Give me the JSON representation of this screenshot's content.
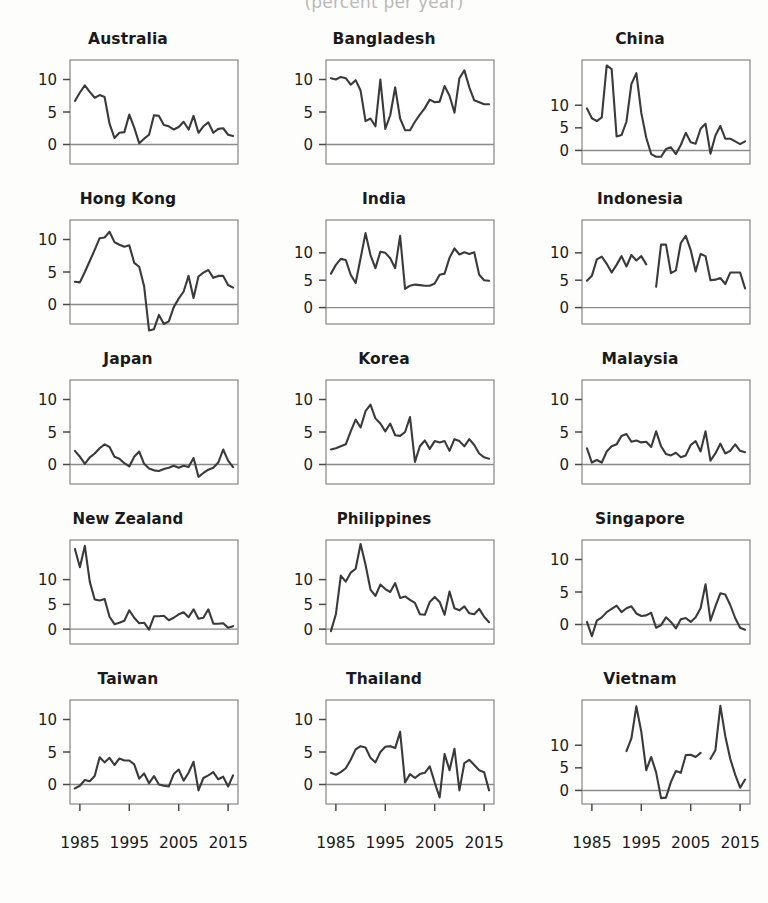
{
  "figure": {
    "title": "(percent per year)",
    "panel_cols": 3,
    "panel_rows": 5
  },
  "axes": {
    "x_ticks": [
      1985,
      1995,
      2005,
      2015
    ],
    "x_tick_labels": [
      "1985",
      "1995",
      "2005",
      "2015"
    ],
    "x_range": [
      1983,
      2017
    ],
    "default_y_ticks": [
      0,
      5,
      10
    ],
    "default_y_tick_labels": [
      "0",
      "5",
      "10"
    ],
    "default_y_range": [
      -3,
      13
    ],
    "wide_y_range": [
      -3,
      20
    ],
    "zero_line": true
  },
  "chart_data": {
    "type": "line",
    "title": "(percent per year)",
    "xlabel": "",
    "ylabel": "percent per year",
    "grid": false,
    "legend": "none",
    "x_tick_labels": [
      "1985",
      "1995",
      "2005",
      "2015"
    ],
    "panels": [
      {
        "name": "Australia",
        "y_ticks": [
          0,
          5,
          10
        ],
        "ylim": [
          -3,
          13
        ],
        "x": [
          1984,
          1985,
          1986,
          1987,
          1988,
          1989,
          1990,
          1991,
          1992,
          1993,
          1994,
          1995,
          1996,
          1997,
          1998,
          1999,
          2000,
          2001,
          2002,
          2003,
          2004,
          2005,
          2006,
          2007,
          2008,
          2009,
          2010,
          2011,
          2012,
          2013,
          2014,
          2015,
          2016
        ],
        "values": [
          6.7,
          8.0,
          9.1,
          8.1,
          7.2,
          7.6,
          7.3,
          3.2,
          1.0,
          1.8,
          1.9,
          4.6,
          2.6,
          0.2,
          0.9,
          1.5,
          4.5,
          4.4,
          3.0,
          2.8,
          2.3,
          2.7,
          3.5,
          2.3,
          4.4,
          1.8,
          2.8,
          3.4,
          1.8,
          2.4,
          2.5,
          1.5,
          1.3
        ]
      },
      {
        "name": "Bangladesh",
        "y_ticks": [
          0,
          5,
          10
        ],
        "ylim": [
          -3,
          13
        ],
        "x": [
          1984,
          1985,
          1986,
          1987,
          1988,
          1989,
          1990,
          1991,
          1992,
          1993,
          1994,
          1995,
          1996,
          1997,
          1998,
          1999,
          2000,
          2001,
          2002,
          2003,
          2004,
          2005,
          2006,
          2007,
          2008,
          2009,
          2010,
          2011,
          2012,
          2013,
          2014,
          2015,
          2016
        ],
        "values": [
          10.2,
          10.0,
          10.4,
          10.2,
          9.2,
          9.9,
          8.3,
          3.6,
          4.0,
          2.8,
          10.0,
          2.4,
          4.5,
          8.8,
          4.0,
          2.2,
          2.2,
          3.5,
          4.6,
          5.6,
          6.9,
          6.5,
          6.6,
          9.0,
          7.5,
          4.9,
          10.2,
          11.4,
          8.8,
          6.8,
          6.5,
          6.2,
          6.2
        ]
      },
      {
        "name": "China",
        "y_ticks": [
          0,
          5,
          10
        ],
        "ylim": [
          -3,
          20
        ],
        "x": [
          1984,
          1985,
          1986,
          1987,
          1988,
          1989,
          1990,
          1991,
          1992,
          1993,
          1994,
          1995,
          1996,
          1997,
          1998,
          1999,
          2000,
          2001,
          2002,
          2003,
          2004,
          2005,
          2006,
          2007,
          2008,
          2009,
          2010,
          2011,
          2012,
          2013,
          2014,
          2015,
          2016
        ],
        "values": [
          9.3,
          7.1,
          6.5,
          7.3,
          18.8,
          18.0,
          3.1,
          3.4,
          6.4,
          14.7,
          17.1,
          8.3,
          2.8,
          -0.8,
          -1.4,
          -1.4,
          0.3,
          0.7,
          -0.8,
          1.2,
          3.9,
          1.8,
          1.5,
          4.8,
          5.9,
          -0.7,
          3.3,
          5.4,
          2.6,
          2.6,
          2.0,
          1.4,
          2.0
        ]
      },
      {
        "name": "Hong Kong",
        "y_ticks": [
          0,
          5,
          10
        ],
        "ylim": [
          -3,
          13
        ],
        "x": [
          1984,
          1985,
          1986,
          1987,
          1988,
          1989,
          1990,
          1991,
          1992,
          1993,
          1994,
          1995,
          1996,
          1997,
          1998,
          1999,
          2000,
          2001,
          2002,
          2003,
          2004,
          2005,
          2006,
          2007,
          2008,
          2009,
          2010,
          2011,
          2012,
          2013,
          2014,
          2015,
          2016
        ],
        "values": [
          3.5,
          3.4,
          5.0,
          6.7,
          8.4,
          10.2,
          10.3,
          11.2,
          9.6,
          9.2,
          8.9,
          9.1,
          6.4,
          5.8,
          2.8,
          -4.0,
          -3.8,
          -1.6,
          -3.0,
          -2.6,
          -0.4,
          0.9,
          2.0,
          4.4,
          1.0,
          4.3,
          4.9,
          5.3,
          4.1,
          4.4,
          4.4,
          3.0,
          2.6
        ]
      },
      {
        "name": "India",
        "y_ticks": [
          0,
          5,
          10
        ],
        "ylim": [
          -3,
          16
        ],
        "x": [
          1984,
          1985,
          1986,
          1987,
          1988,
          1989,
          1990,
          1991,
          1992,
          1993,
          1994,
          1995,
          1996,
          1997,
          1998,
          1999,
          2000,
          2001,
          2002,
          2003,
          2004,
          2005,
          2006,
          2007,
          2008,
          2009,
          2010,
          2011,
          2012,
          2013,
          2014,
          2015,
          2016
        ],
        "values": [
          6.2,
          7.8,
          8.9,
          8.7,
          6.0,
          4.5,
          9.0,
          13.6,
          9.6,
          7.2,
          10.2,
          10.0,
          9.0,
          7.2,
          13.1,
          3.4,
          4.0,
          4.2,
          4.1,
          4.0,
          4.0,
          4.4,
          6.0,
          6.2,
          9.1,
          10.8,
          9.7,
          10.1,
          9.8,
          10.1,
          6.0,
          5.0,
          4.9
        ]
      },
      {
        "name": "Indonesia",
        "y_ticks": [
          0,
          5,
          10
        ],
        "ylim": [
          -3,
          16
        ],
        "x": [
          1984,
          1985,
          1986,
          1987,
          1988,
          1989,
          1990,
          1991,
          1992,
          1993,
          1994,
          1995,
          1996,
          1998,
          1999,
          2000,
          2001,
          2002,
          2003,
          2004,
          2005,
          2006,
          2007,
          2008,
          2009,
          2010,
          2011,
          2012,
          2013,
          2014,
          2015,
          2016
        ],
        "values": [
          4.9,
          5.8,
          8.8,
          9.3,
          8.0,
          6.4,
          7.8,
          9.4,
          7.5,
          9.6,
          8.6,
          9.4,
          7.9,
          3.8,
          11.5,
          11.5,
          6.3,
          6.8,
          11.8,
          13.1,
          10.5,
          6.6,
          9.8,
          9.4,
          5.0,
          5.1,
          5.4,
          4.3,
          6.4,
          6.4,
          6.4,
          3.5
        ]
      },
      {
        "name": "Japan",
        "y_ticks": [
          0,
          5,
          10
        ],
        "ylim": [
          -3,
          13
        ],
        "x": [
          1984,
          1985,
          1986,
          1987,
          1988,
          1989,
          1990,
          1991,
          1992,
          1993,
          1994,
          1995,
          1996,
          1997,
          1998,
          1999,
          2000,
          2001,
          2002,
          2003,
          2004,
          2005,
          2006,
          2007,
          2008,
          2009,
          2010,
          2011,
          2012,
          2013,
          2014,
          2015,
          2016
        ],
        "values": [
          2.1,
          1.2,
          0.1,
          1.1,
          1.7,
          2.5,
          3.1,
          2.7,
          1.2,
          0.9,
          0.2,
          -0.3,
          1.2,
          2.0,
          0.1,
          -0.6,
          -0.9,
          -1.0,
          -0.7,
          -0.5,
          -0.2,
          -0.5,
          -0.2,
          -0.4,
          1.0,
          -1.9,
          -1.3,
          -0.8,
          -0.5,
          0.3,
          2.3,
          0.6,
          -0.4
        ]
      },
      {
        "name": "Korea",
        "y_ticks": [
          0,
          5,
          10
        ],
        "ylim": [
          -3,
          13
        ],
        "x": [
          1984,
          1985,
          1986,
          1987,
          1988,
          1989,
          1990,
          1991,
          1992,
          1993,
          1994,
          1995,
          1996,
          1997,
          1998,
          1999,
          2000,
          2001,
          2002,
          2003,
          2004,
          2005,
          2006,
          2007,
          2008,
          2009,
          2010,
          2011,
          2012,
          2013,
          2014,
          2015,
          2016
        ],
        "values": [
          2.3,
          2.5,
          2.8,
          3.1,
          5.1,
          6.9,
          5.7,
          8.2,
          9.2,
          7.1,
          6.3,
          5.1,
          6.3,
          4.5,
          4.4,
          5.0,
          7.3,
          0.4,
          2.8,
          3.7,
          2.4,
          3.6,
          3.4,
          3.6,
          2.1,
          3.9,
          3.6,
          2.8,
          3.9,
          3.0,
          1.7,
          1.1,
          0.9,
          0.7
        ]
      },
      {
        "name": "Malaysia",
        "y_ticks": [
          0,
          5,
          10
        ],
        "ylim": [
          -3,
          13
        ],
        "x": [
          1984,
          1985,
          1986,
          1987,
          1988,
          1989,
          1990,
          1991,
          1992,
          1993,
          1994,
          1995,
          1996,
          1997,
          1998,
          1999,
          2000,
          2001,
          2002,
          2003,
          2004,
          2005,
          2006,
          2007,
          2008,
          2009,
          2010,
          2011,
          2012,
          2013,
          2014,
          2015,
          2016
        ],
        "values": [
          2.5,
          0.3,
          0.7,
          0.3,
          2.0,
          2.8,
          3.1,
          4.4,
          4.7,
          3.5,
          3.7,
          3.4,
          3.5,
          2.7,
          5.1,
          2.8,
          1.6,
          1.4,
          1.8,
          1.1,
          1.4,
          3.0,
          3.6,
          2.0,
          5.1,
          0.6,
          1.7,
          3.2,
          1.7,
          2.1,
          3.1,
          2.1,
          1.9
        ]
      },
      {
        "name": "New Zealand",
        "y_ticks": [
          0,
          5,
          10
        ],
        "ylim": [
          -3,
          18
        ],
        "x": [
          1984,
          1985,
          1986,
          1987,
          1988,
          1989,
          1990,
          1991,
          1992,
          1993,
          1994,
          1995,
          1996,
          1997,
          1998,
          1999,
          2000,
          2001,
          2002,
          2003,
          2004,
          2005,
          2006,
          2007,
          2008,
          2009,
          2010,
          2011,
          2012,
          2013,
          2014,
          2015,
          2016
        ],
        "values": [
          16.2,
          12.5,
          16.8,
          9.6,
          6.0,
          5.8,
          6.1,
          2.5,
          1.0,
          1.3,
          1.7,
          3.8,
          2.3,
          1.2,
          1.3,
          -0.1,
          2.6,
          2.6,
          2.7,
          1.8,
          2.3,
          3.0,
          3.4,
          2.4,
          4.0,
          2.1,
          2.3,
          4.0,
          1.1,
          1.1,
          1.2,
          0.3,
          0.6
        ]
      },
      {
        "name": "Philippines",
        "y_ticks": [
          0,
          5,
          10
        ],
        "ylim": [
          -3,
          18
        ],
        "x": [
          1984,
          1985,
          1986,
          1987,
          1988,
          1989,
          1990,
          1991,
          1992,
          1993,
          1994,
          1995,
          1996,
          1997,
          1998,
          1999,
          2000,
          2001,
          2002,
          2003,
          2004,
          2005,
          2006,
          2007,
          2008,
          2009,
          2010,
          2011,
          2012,
          2013,
          2014,
          2015,
          2016
        ],
        "values": [
          -0.4,
          3.0,
          10.8,
          9.6,
          11.4,
          12.2,
          17.2,
          13.0,
          8.0,
          6.7,
          9.0,
          8.1,
          7.5,
          9.3,
          6.3,
          6.6,
          5.9,
          5.3,
          3.0,
          2.9,
          5.5,
          6.5,
          5.5,
          2.9,
          7.6,
          4.2,
          3.8,
          4.6,
          3.2,
          3.0,
          4.1,
          2.5,
          1.4,
          1.6
        ]
      },
      {
        "name": "Singapore",
        "y_ticks": [
          0,
          5,
          10
        ],
        "ylim": [
          -3,
          13
        ],
        "x": [
          1984,
          1985,
          1986,
          1987,
          1988,
          1989,
          1990,
          1991,
          1992,
          1993,
          1994,
          1995,
          1996,
          1997,
          1998,
          1999,
          2000,
          2001,
          2002,
          2003,
          2004,
          2005,
          2006,
          2007,
          2008,
          2009,
          2010,
          2011,
          2012,
          2013,
          2014,
          2015,
          2016
        ],
        "values": [
          0.4,
          -1.8,
          0.6,
          1.1,
          1.9,
          2.4,
          2.9,
          1.9,
          2.5,
          2.8,
          1.7,
          1.3,
          1.4,
          1.8,
          -0.5,
          -0.1,
          1.1,
          0.4,
          -0.6,
          0.8,
          1.0,
          0.4,
          1.1,
          2.5,
          6.2,
          0.6,
          2.8,
          4.8,
          4.6,
          3.0,
          1.0,
          -0.5,
          -0.8
        ]
      },
      {
        "name": "Taiwan",
        "y_ticks": [
          0,
          5,
          10
        ],
        "ylim": [
          -3,
          13
        ],
        "x": [
          1984,
          1985,
          1986,
          1987,
          1988,
          1989,
          1990,
          1991,
          1992,
          1993,
          1994,
          1995,
          1996,
          1997,
          1998,
          1999,
          2000,
          2001,
          2002,
          2003,
          2004,
          2005,
          2006,
          2007,
          2008,
          2009,
          2010,
          2011,
          2012,
          2013,
          2014,
          2015,
          2016
        ],
        "values": [
          -0.6,
          -0.2,
          0.7,
          0.5,
          1.3,
          4.2,
          3.4,
          4.1,
          3.0,
          4.0,
          3.7,
          3.7,
          3.1,
          0.9,
          1.7,
          0.2,
          1.3,
          0.0,
          -0.2,
          -0.3,
          1.6,
          2.3,
          0.6,
          1.8,
          3.5,
          -0.9,
          1.0,
          1.4,
          1.9,
          0.8,
          1.2,
          -0.3,
          1.4
        ]
      },
      {
        "name": "Thailand",
        "y_ticks": [
          0,
          5,
          10
        ],
        "ylim": [
          -3,
          13
        ],
        "x": [
          1984,
          1985,
          1986,
          1987,
          1988,
          1989,
          1990,
          1991,
          1992,
          1993,
          1994,
          1995,
          1996,
          1997,
          1998,
          1999,
          2000,
          2001,
          2002,
          2003,
          2004,
          2005,
          2006,
          2007,
          2008,
          2009,
          2010,
          2011,
          2012,
          2013,
          2014,
          2015,
          2016
        ],
        "values": [
          1.8,
          1.5,
          1.9,
          2.5,
          3.8,
          5.4,
          5.9,
          5.7,
          4.1,
          3.4,
          5.0,
          5.8,
          5.9,
          5.6,
          8.1,
          0.3,
          1.6,
          1.0,
          1.6,
          1.8,
          2.8,
          0.3,
          -2.0,
          4.7,
          2.2,
          5.5,
          -0.9,
          3.3,
          3.8,
          3.0,
          2.2,
          1.9,
          -0.9,
          0.2
        ]
      },
      {
        "name": "Vietnam",
        "y_ticks": [
          0,
          5,
          10
        ],
        "ylim": [
          -3,
          20
        ],
        "x": [
          1992,
          1993,
          1994,
          1995,
          1996,
          1997,
          1998,
          1999,
          2000,
          2001,
          2002,
          2003,
          2004,
          2005,
          2006,
          2007,
          2009,
          2010,
          2011,
          2012,
          2013,
          2014,
          2015,
          2016
        ],
        "values": [
          8.7,
          11.5,
          18.6,
          13.0,
          4.5,
          7.4,
          4.0,
          -1.7,
          -1.6,
          1.9,
          4.3,
          3.9,
          7.8,
          7.9,
          7.4,
          8.3,
          7.0,
          8.9,
          18.7,
          12.0,
          7.0,
          3.5,
          0.6,
          2.4
        ]
      }
    ]
  }
}
